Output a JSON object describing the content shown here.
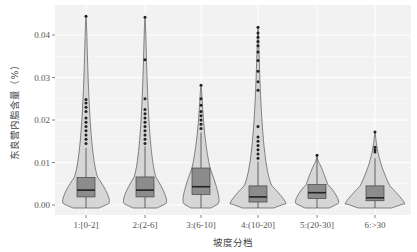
{
  "chart_data": {
    "type": "violin+box",
    "title": "",
    "xlabel": "坡度分档",
    "ylabel": "东良营内脂含量（%）",
    "ylim": [
      -0.0015,
      0.0455
    ],
    "yticks": [
      0.0,
      0.01,
      0.02,
      0.03,
      0.04
    ],
    "ytick_labels": [
      "0.00",
      "0.01",
      "0.02",
      "0.03",
      "0.04"
    ],
    "grid": true,
    "legend": null,
    "categories": [
      "1:[0-2]",
      "2:(2-6]",
      "3:(6-10]",
      "4:(10-20]",
      "5:(20-30]",
      "6:>30"
    ],
    "series": [
      {
        "name": "1:[0-2]",
        "min": 0.0,
        "q1": 0.0019,
        "median": 0.0035,
        "q3": 0.0065,
        "whisker_high": 0.0134,
        "max": 0.0444,
        "outliers": [
          0.0444,
          0.0248,
          0.024,
          0.023,
          0.022,
          0.0205,
          0.0195,
          0.0185,
          0.0175,
          0.0165,
          0.0155,
          0.0145
        ],
        "violin_half_width": 26
      },
      {
        "name": "2:(2-6]",
        "min": 0.0,
        "q1": 0.0019,
        "median": 0.0035,
        "q3": 0.0066,
        "whisker_high": 0.0138,
        "max": 0.0442,
        "outliers": [
          0.0442,
          0.0342,
          0.025,
          0.0225,
          0.0215,
          0.0205,
          0.0195,
          0.0185,
          0.0175,
          0.0165,
          0.0155,
          0.0145
        ],
        "violin_half_width": 24
      },
      {
        "name": "3:(6-10]",
        "min": 0.0,
        "q1": 0.0025,
        "median": 0.0043,
        "q3": 0.0087,
        "whisker_high": 0.017,
        "max": 0.0282,
        "outliers": [
          0.0282,
          0.025,
          0.0235,
          0.022,
          0.021,
          0.02,
          0.019,
          0.018
        ],
        "violin_half_width": 20
      },
      {
        "name": "4:(10-20]",
        "min": 0.0,
        "q1": 0.0007,
        "median": 0.0019,
        "q3": 0.0045,
        "whisker_high": 0.0102,
        "max": 0.0418,
        "outliers": [
          0.0418,
          0.0405,
          0.0395,
          0.0385,
          0.0375,
          0.036,
          0.034,
          0.0315,
          0.029,
          0.027,
          0.0185,
          0.016,
          0.015,
          0.014,
          0.013,
          0.012,
          0.011
        ],
        "violin_half_width": 31
      },
      {
        "name": "5:(20-30]",
        "min": 0.0,
        "q1": 0.0015,
        "median": 0.0029,
        "q3": 0.0048,
        "whisker_high": 0.0112,
        "max": 0.0117,
        "outliers": [
          0.0117
        ],
        "violin_half_width": 24
      },
      {
        "name": "6:>30",
        "min": 0.0,
        "q1": 0.001,
        "median": 0.0017,
        "q3": 0.0045,
        "whisker_high": 0.011,
        "max": 0.0172,
        "outliers": [
          0.0172,
          0.0136,
          0.013,
          0.0125
        ],
        "violin_half_width": 33
      }
    ]
  },
  "colors": {
    "panel_bg": "#f2f2f2",
    "grid": "#ffffff",
    "violin_fill": "#d6d6d6",
    "violin_stroke": "#555555",
    "box_fill": "#8c8c8c",
    "box_stroke": "#444444",
    "median": "#222222",
    "outlier": "#222222"
  }
}
